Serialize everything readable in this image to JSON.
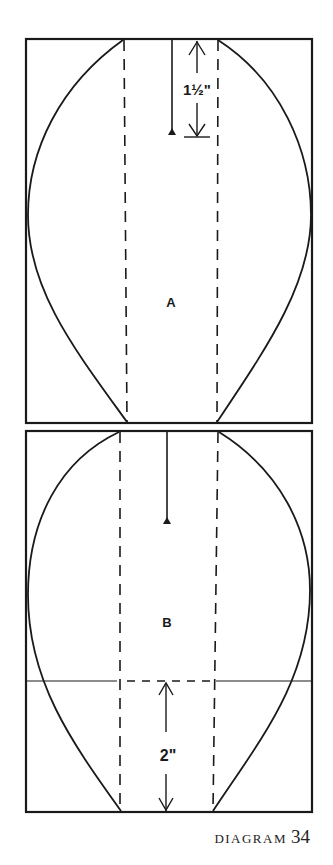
{
  "diagram": {
    "panels": [
      {
        "id": "A",
        "label": "A",
        "measurement": {
          "label": "1½\"",
          "direction": "from top down to pivot mark"
        }
      },
      {
        "id": "B",
        "label": "B",
        "measurement": {
          "label": "2\"",
          "direction": "from bottom up to horizontal line"
        }
      }
    ],
    "stroke_color": "#1a1a1a",
    "background": "#ffffff"
  },
  "caption": {
    "word": "DIAGRAM",
    "number": "34"
  }
}
